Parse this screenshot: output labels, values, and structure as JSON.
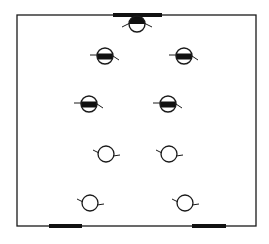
{
  "diagram": {
    "type": "floor-plan-lighting-layout",
    "canvas": {
      "width": 269,
      "height": 244,
      "background": "#ffffff"
    },
    "colors": {
      "stroke": "#1a1a1a",
      "fill": "#111111"
    },
    "frame": {
      "x1": 17,
      "y1": 15,
      "x2": 256,
      "y2": 226
    },
    "openings": [
      {
        "name": "top-opening",
        "x1": 113,
        "x2": 162,
        "y": 15
      },
      {
        "name": "bottom-left-opening",
        "x1": 49,
        "x2": 82,
        "y": 226
      },
      {
        "name": "bottom-right-opening",
        "x1": 192,
        "x2": 226,
        "y": 226
      }
    ],
    "fixtures": [
      {
        "id": "wall-fixture-top",
        "kind": "wall-mounted-half-filled",
        "cx": 137,
        "cy": 24,
        "r": 8
      },
      {
        "id": "fixture-r1-left",
        "kind": "banded-filled",
        "cx": 105,
        "cy": 56,
        "r": 8,
        "tilt": 8
      },
      {
        "id": "fixture-r1-right",
        "kind": "banded-filled",
        "cx": 184,
        "cy": 56,
        "r": 8,
        "tilt": 8
      },
      {
        "id": "fixture-r2-left",
        "kind": "banded-filled",
        "cx": 89,
        "cy": 104,
        "r": 8,
        "tilt": 8
      },
      {
        "id": "fixture-r2-right",
        "kind": "banded-filled",
        "cx": 168,
        "cy": 104,
        "r": 8,
        "tilt": 8
      },
      {
        "id": "fixture-r3-left",
        "kind": "open",
        "cx": 106,
        "cy": 154,
        "r": 8,
        "tilt": -15
      },
      {
        "id": "fixture-r3-right",
        "kind": "open",
        "cx": 169,
        "cy": 154,
        "r": 8,
        "tilt": -8
      },
      {
        "id": "fixture-r4-left",
        "kind": "open",
        "cx": 90,
        "cy": 203,
        "r": 8,
        "tilt": -12
      },
      {
        "id": "fixture-r4-right",
        "kind": "open",
        "cx": 185,
        "cy": 203,
        "r": 8,
        "tilt": -8
      }
    ]
  }
}
